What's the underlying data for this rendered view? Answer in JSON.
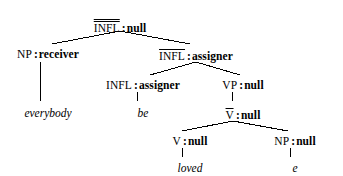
{
  "figure": {
    "kind": "syntax-tree",
    "background_color": "#ffffff",
    "line_color": "#000000",
    "text_color": "#000000"
  },
  "nodes": {
    "root": {
      "category": "INFL",
      "bars": 2,
      "separator": ":",
      "value": "null",
      "x": 120,
      "y": 18
    },
    "np_subject": {
      "category": "NP",
      "bars": 0,
      "separator": ":",
      "value": "receiver",
      "x": 48,
      "y": 48
    },
    "infl_bar": {
      "category": "INFL",
      "bars": 1,
      "separator": ":",
      "value": "assigner",
      "x": 196,
      "y": 48
    },
    "infl_head": {
      "category": "INFL",
      "bars": 0,
      "separator": ":",
      "value": "assigner",
      "x": 143,
      "y": 79
    },
    "vp": {
      "category": "VP",
      "bars": 0,
      "separator": ":",
      "value": "null",
      "x": 243,
      "y": 79
    },
    "v_bar": {
      "category": "V",
      "bars": 1,
      "separator": ":",
      "value": "null",
      "x": 243,
      "y": 107
    },
    "v_head": {
      "category": "V",
      "bars": 0,
      "separator": ":",
      "value": "null",
      "x": 190,
      "y": 135
    },
    "np_object": {
      "category": "NP",
      "bars": 0,
      "separator": ":",
      "value": "null",
      "x": 295,
      "y": 135
    }
  },
  "leaves": {
    "everybody": {
      "text": "everybody",
      "x": 48,
      "y": 107
    },
    "be": {
      "text": "be",
      "x": 143,
      "y": 107
    },
    "loved": {
      "text": "loved",
      "x": 190,
      "y": 162
    },
    "empty_category": {
      "text": "e",
      "x": 295,
      "y": 162
    }
  },
  "edges": [
    {
      "name": "root-to-np-subject",
      "x1": 120,
      "y1": 31,
      "x2": 52,
      "y2": 44
    },
    {
      "name": "root-to-infl-bar",
      "x1": 120,
      "y1": 31,
      "x2": 190,
      "y2": 44
    },
    {
      "name": "np-subject-to-everybody",
      "x1": 40,
      "y1": 62,
      "x2": 40,
      "y2": 101
    },
    {
      "name": "infl-bar-to-infl-head",
      "x1": 196,
      "y1": 62,
      "x2": 150,
      "y2": 75
    },
    {
      "name": "infl-bar-to-vp",
      "x1": 196,
      "y1": 62,
      "x2": 240,
      "y2": 75
    },
    {
      "name": "infl-head-to-be",
      "x1": 137,
      "y1": 92,
      "x2": 137,
      "y2": 101
    },
    {
      "name": "vp-to-v-bar",
      "x1": 232,
      "y1": 92,
      "x2": 232,
      "y2": 101
    },
    {
      "name": "v-bar-to-v-head",
      "x1": 233,
      "y1": 121,
      "x2": 182,
      "y2": 131
    },
    {
      "name": "v-bar-to-np-object",
      "x1": 233,
      "y1": 121,
      "x2": 288,
      "y2": 131
    },
    {
      "name": "v-head-to-loved",
      "x1": 182,
      "y1": 148,
      "x2": 182,
      "y2": 157
    },
    {
      "name": "np-object-to-e",
      "x1": 290,
      "y1": 148,
      "x2": 290,
      "y2": 157
    }
  ]
}
